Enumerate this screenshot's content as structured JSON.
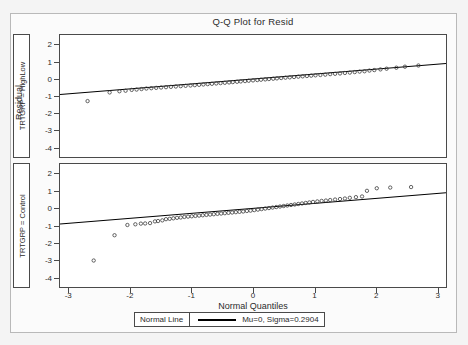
{
  "page": {
    "title": "Q-Q Plot for Resid",
    "background": "#f4f4f4",
    "border_color": "#b9b9b9"
  },
  "axes": {
    "xlabel": "Normal Quantiles",
    "ylabel": "Residual",
    "xticks": [
      "-3",
      "-2",
      "-1",
      "0",
      "1",
      "2",
      "3"
    ],
    "yticks": [
      "2",
      "1",
      "0",
      "-1",
      "-2",
      "-3",
      "-4"
    ]
  },
  "strips": {
    "top": "TRTGRP = HighLow",
    "bottom": "TRTGRP = Control"
  },
  "legend": {
    "label": "Normal Line",
    "series": "Mu=0, Sigma=0.2904",
    "line_color": "#000000"
  },
  "chart_data": {
    "type": "scatter",
    "title": "Q-Q Plot for Resid",
    "xlabel": "Normal Quantiles",
    "ylabel": "Residual",
    "xlim": [
      -3.15,
      3.15
    ],
    "ylim": [
      -4.6,
      2.6
    ],
    "grid": false,
    "legend_position": "bottom",
    "reference_line": {
      "name": "Normal Line",
      "label": "Mu=0, Sigma=0.2904",
      "mu": 0,
      "sigma": 0.2904,
      "color": "#000000"
    },
    "panels": [
      {
        "name": "TRTGRP = HighLow",
        "marker": "open-circle",
        "marker_color": "#3a3a3a",
        "points": [
          [
            -2.7,
            -1.3
          ],
          [
            -2.34,
            -0.79
          ],
          [
            -2.18,
            -0.72
          ],
          [
            -2.08,
            -0.69
          ],
          [
            -1.98,
            -0.64
          ],
          [
            -1.9,
            -0.62
          ],
          [
            -1.82,
            -0.59
          ],
          [
            -1.74,
            -0.56
          ],
          [
            -1.66,
            -0.54
          ],
          [
            -1.58,
            -0.52
          ],
          [
            -1.5,
            -0.5
          ],
          [
            -1.42,
            -0.48
          ],
          [
            -1.34,
            -0.46
          ],
          [
            -1.26,
            -0.44
          ],
          [
            -1.18,
            -0.42
          ],
          [
            -1.1,
            -0.4
          ],
          [
            -1.02,
            -0.38
          ],
          [
            -0.95,
            -0.36
          ],
          [
            -0.88,
            -0.34
          ],
          [
            -0.81,
            -0.32
          ],
          [
            -0.74,
            -0.3
          ],
          [
            -0.67,
            -0.28
          ],
          [
            -0.6,
            -0.26
          ],
          [
            -0.53,
            -0.24
          ],
          [
            -0.46,
            -0.22
          ],
          [
            -0.39,
            -0.2
          ],
          [
            -0.33,
            -0.18
          ],
          [
            -0.26,
            -0.16
          ],
          [
            -0.2,
            -0.14
          ],
          [
            -0.13,
            -0.12
          ],
          [
            -0.07,
            -0.1
          ],
          [
            0.0,
            -0.08
          ],
          [
            0.07,
            -0.06
          ],
          [
            0.13,
            -0.04
          ],
          [
            0.2,
            -0.02
          ],
          [
            0.26,
            0.0
          ],
          [
            0.33,
            0.02
          ],
          [
            0.39,
            0.04
          ],
          [
            0.46,
            0.06
          ],
          [
            0.53,
            0.08
          ],
          [
            0.6,
            0.1
          ],
          [
            0.67,
            0.12
          ],
          [
            0.74,
            0.14
          ],
          [
            0.81,
            0.16
          ],
          [
            0.88,
            0.18
          ],
          [
            0.95,
            0.2
          ],
          [
            1.02,
            0.22
          ],
          [
            1.1,
            0.24
          ],
          [
            1.18,
            0.26
          ],
          [
            1.26,
            0.29
          ],
          [
            1.34,
            0.31
          ],
          [
            1.42,
            0.33
          ],
          [
            1.5,
            0.36
          ],
          [
            1.58,
            0.38
          ],
          [
            1.66,
            0.41
          ],
          [
            1.74,
            0.44
          ],
          [
            1.82,
            0.46
          ],
          [
            1.9,
            0.5
          ],
          [
            1.98,
            0.53
          ],
          [
            2.08,
            0.57
          ],
          [
            2.18,
            0.61
          ],
          [
            2.34,
            0.67
          ],
          [
            2.48,
            0.73
          ],
          [
            2.7,
            0.8
          ]
        ]
      },
      {
        "name": "TRTGRP = Control",
        "marker": "open-circle",
        "marker_color": "#3a3a3a",
        "points": [
          [
            -2.6,
            -3.05
          ],
          [
            -2.26,
            -1.57
          ],
          [
            -2.05,
            -0.97
          ],
          [
            -1.92,
            -0.93
          ],
          [
            -1.83,
            -0.89
          ],
          [
            -1.76,
            -0.88
          ],
          [
            -1.68,
            -0.86
          ],
          [
            -1.6,
            -0.76
          ],
          [
            -1.55,
            -0.74
          ],
          [
            -1.48,
            -0.7
          ],
          [
            -1.42,
            -0.63
          ],
          [
            -1.36,
            -0.61
          ],
          [
            -1.3,
            -0.58
          ],
          [
            -1.24,
            -0.55
          ],
          [
            -1.18,
            -0.53
          ],
          [
            -1.12,
            -0.5
          ],
          [
            -1.06,
            -0.48
          ],
          [
            -1.0,
            -0.46
          ],
          [
            -0.94,
            -0.44
          ],
          [
            -0.88,
            -0.42
          ],
          [
            -0.82,
            -0.4
          ],
          [
            -0.76,
            -0.38
          ],
          [
            -0.7,
            -0.36
          ],
          [
            -0.64,
            -0.34
          ],
          [
            -0.58,
            -0.32
          ],
          [
            -0.52,
            -0.3
          ],
          [
            -0.46,
            -0.28
          ],
          [
            -0.4,
            -0.26
          ],
          [
            -0.34,
            -0.24
          ],
          [
            -0.28,
            -0.22
          ],
          [
            -0.22,
            -0.2
          ],
          [
            -0.16,
            -0.18
          ],
          [
            -0.1,
            -0.15
          ],
          [
            -0.04,
            -0.13
          ],
          [
            0.02,
            -0.1
          ],
          [
            0.08,
            -0.07
          ],
          [
            0.14,
            -0.04
          ],
          [
            0.2,
            -0.01
          ],
          [
            0.26,
            0.02
          ],
          [
            0.32,
            0.05
          ],
          [
            0.38,
            0.08
          ],
          [
            0.44,
            0.11
          ],
          [
            0.5,
            0.14
          ],
          [
            0.56,
            0.17
          ],
          [
            0.62,
            0.2
          ],
          [
            0.68,
            0.23
          ],
          [
            0.74,
            0.26
          ],
          [
            0.8,
            0.29
          ],
          [
            0.86,
            0.32
          ],
          [
            0.92,
            0.35
          ],
          [
            0.98,
            0.38
          ],
          [
            1.05,
            0.41
          ],
          [
            1.12,
            0.44
          ],
          [
            1.19,
            0.46
          ],
          [
            1.26,
            0.49
          ],
          [
            1.34,
            0.52
          ],
          [
            1.42,
            0.55
          ],
          [
            1.5,
            0.58
          ],
          [
            1.58,
            0.62
          ],
          [
            1.68,
            0.66
          ],
          [
            1.78,
            0.7
          ],
          [
            1.86,
            1.03
          ],
          [
            2.02,
            1.18
          ],
          [
            2.24,
            1.22
          ],
          [
            2.58,
            1.25
          ]
        ]
      }
    ]
  }
}
